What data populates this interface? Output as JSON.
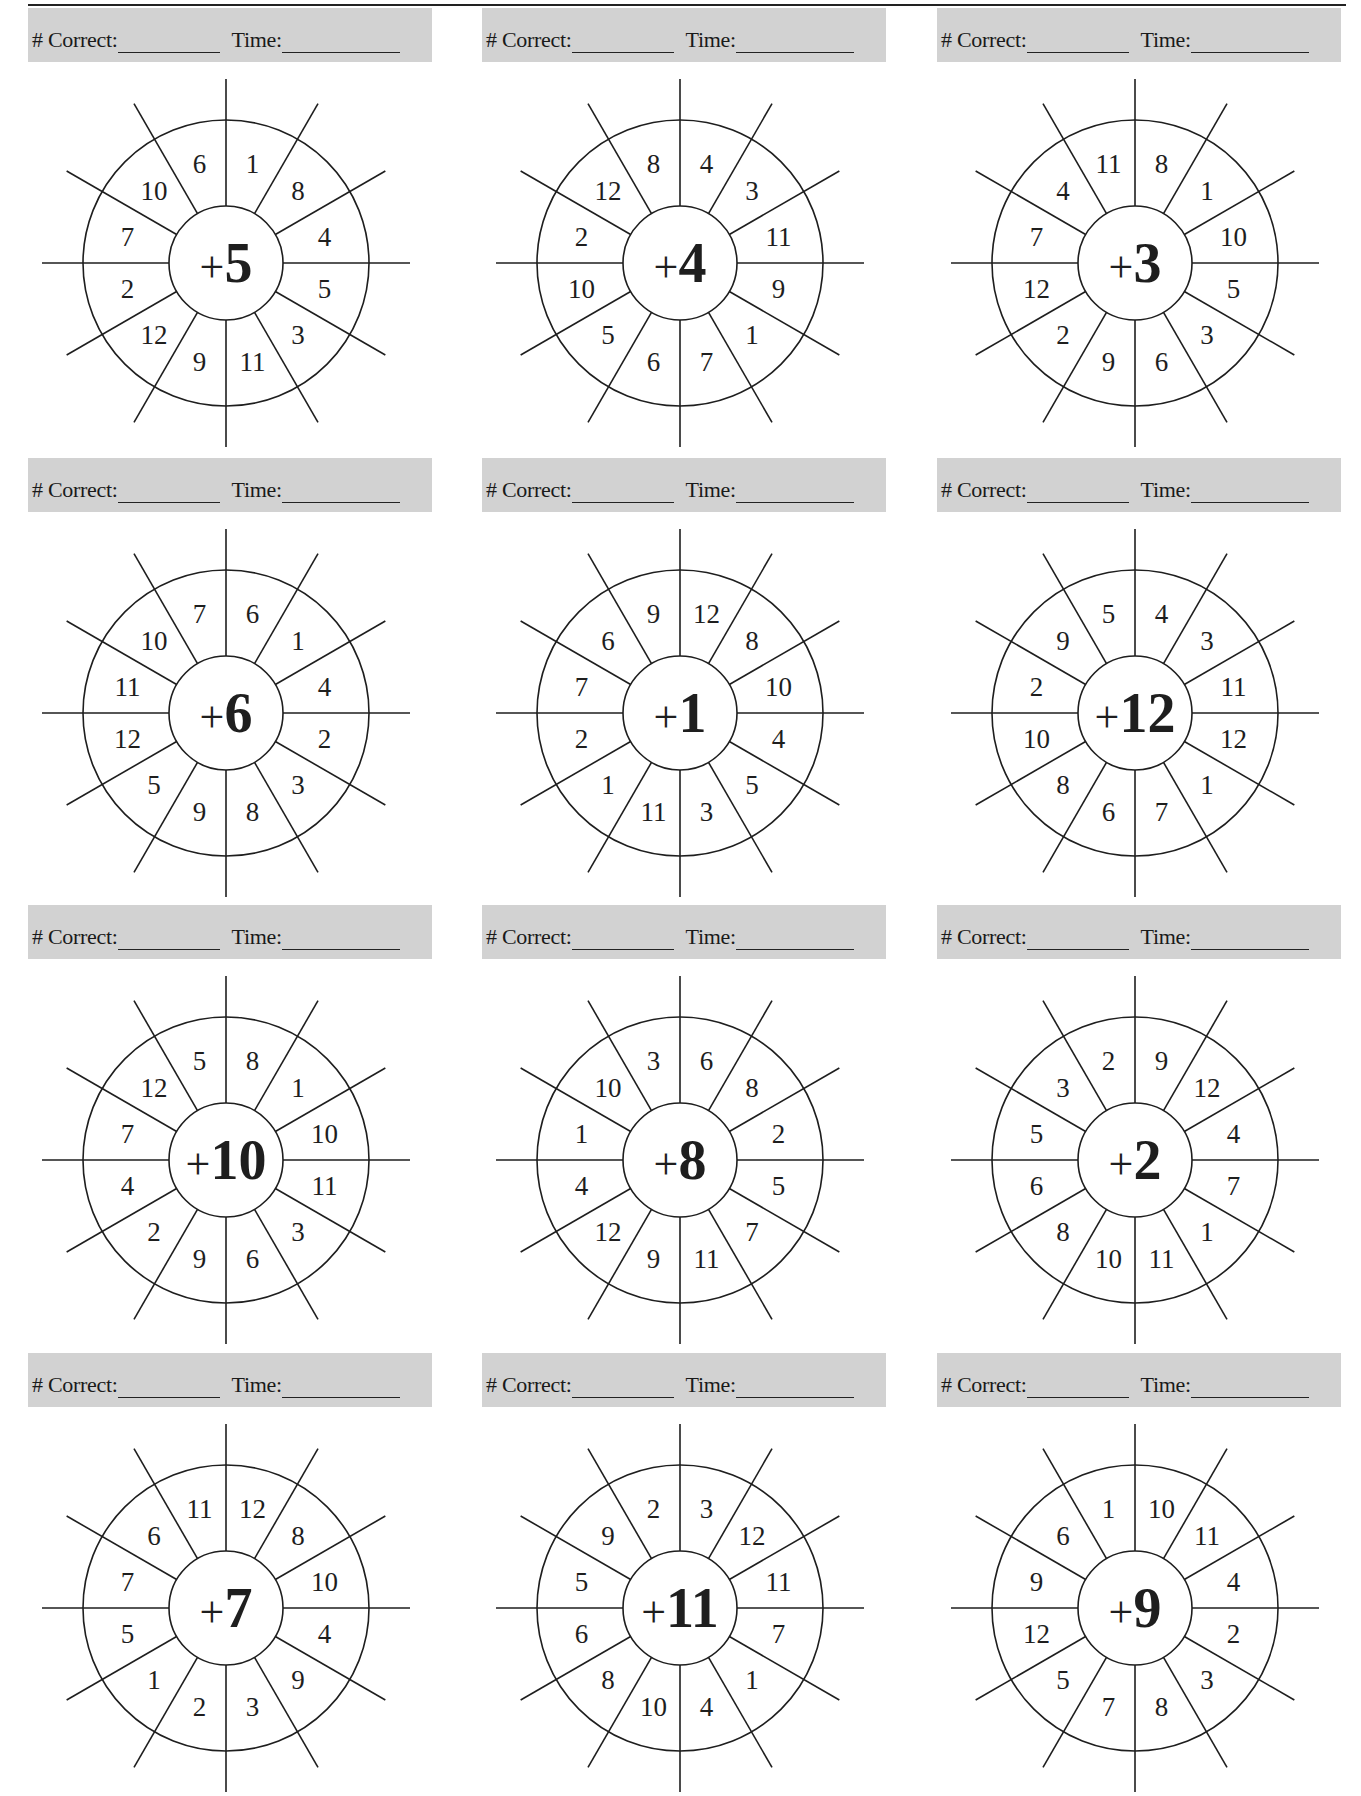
{
  "page": {
    "page_number_partial": "",
    "header_labels": {
      "correct": "# Correct:",
      "time": "Time:"
    }
  },
  "wheels": [
    {
      "addend": "5",
      "numbers": [
        "1",
        "8",
        "4",
        "5",
        "3",
        "11",
        "9",
        "12",
        "2",
        "7",
        "10",
        "6"
      ]
    },
    {
      "addend": "4",
      "numbers": [
        "4",
        "3",
        "11",
        "9",
        "1",
        "7",
        "6",
        "5",
        "10",
        "2",
        "12",
        "8"
      ]
    },
    {
      "addend": "3",
      "numbers": [
        "8",
        "1",
        "10",
        "5",
        "3",
        "6",
        "9",
        "2",
        "12",
        "7",
        "4",
        "11"
      ]
    },
    {
      "addend": "6",
      "numbers": [
        "6",
        "1",
        "4",
        "2",
        "3",
        "8",
        "9",
        "5",
        "12",
        "11",
        "10",
        "7"
      ]
    },
    {
      "addend": "1",
      "numbers": [
        "12",
        "8",
        "10",
        "4",
        "5",
        "3",
        "11",
        "1",
        "2",
        "7",
        "6",
        "9"
      ]
    },
    {
      "addend": "12",
      "numbers": [
        "4",
        "3",
        "11",
        "12",
        "1",
        "7",
        "6",
        "8",
        "10",
        "2",
        "9",
        "5"
      ]
    },
    {
      "addend": "10",
      "numbers": [
        "8",
        "1",
        "10",
        "11",
        "3",
        "6",
        "9",
        "2",
        "4",
        "7",
        "12",
        "5"
      ]
    },
    {
      "addend": "8",
      "numbers": [
        "6",
        "8",
        "2",
        "5",
        "7",
        "11",
        "9",
        "12",
        "4",
        "1",
        "10",
        "3"
      ]
    },
    {
      "addend": "2",
      "numbers": [
        "9",
        "12",
        "4",
        "7",
        "1",
        "11",
        "10",
        "8",
        "6",
        "5",
        "3",
        "2"
      ]
    },
    {
      "addend": "7",
      "numbers": [
        "12",
        "8",
        "10",
        "4",
        "9",
        "3",
        "2",
        "1",
        "5",
        "7",
        "6",
        "11"
      ]
    },
    {
      "addend": "11",
      "numbers": [
        "3",
        "12",
        "11",
        "7",
        "1",
        "4",
        "10",
        "8",
        "6",
        "5",
        "9",
        "2"
      ]
    },
    {
      "addend": "9",
      "numbers": [
        "10",
        "11",
        "4",
        "2",
        "3",
        "8",
        "7",
        "5",
        "12",
        "9",
        "6",
        "1"
      ]
    }
  ],
  "layout": {
    "cols_x": [
      28,
      482,
      937
    ],
    "rows_y": [
      8,
      458,
      905,
      1353
    ],
    "colors": {
      "header_bg": "#d2d2d2",
      "ink": "#1e1e1e"
    }
  }
}
